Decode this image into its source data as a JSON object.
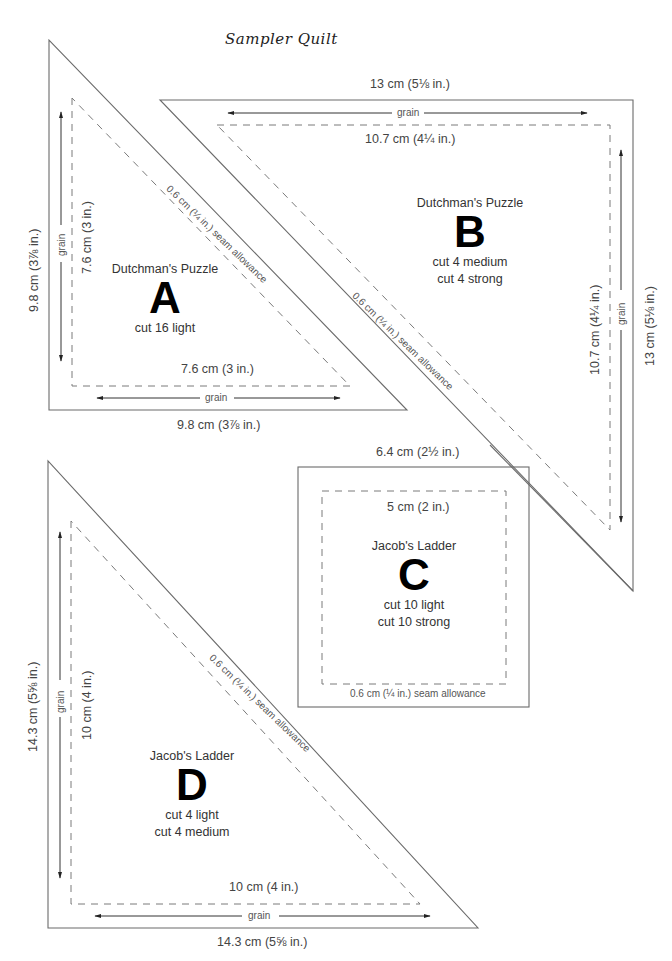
{
  "title": "Sampler Quilt",
  "pieces": {
    "A": {
      "block_name": "Dutchman's Puzzle",
      "letter": "A",
      "cut": [
        "cut 16 light"
      ],
      "outer_vertical": "9.8 cm (3⅞ in.)",
      "inner_vertical": "7.6 cm (3 in.)",
      "inner_horizontal": "7.6 cm (3 in.)",
      "outer_horizontal": "9.8 cm (3⅞ in.)",
      "grain_label": "grain",
      "seam_label": "0.6 cm (¼ in.) seam allowance"
    },
    "B": {
      "block_name": "Dutchman's Puzzle",
      "letter": "B",
      "cut": [
        "cut 4 medium",
        "cut 4 strong"
      ],
      "outer_horizontal": "13 cm (5⅛ in.)",
      "inner_horizontal": "10.7 cm (4¼ in.)",
      "inner_vertical": "10.7 cm (4¼ in.)",
      "outer_vertical": "13 cm (5⅛ in.)",
      "grain_label": "grain",
      "seam_label": "0.6 cm (¼ in.) seam allowance"
    },
    "C": {
      "block_name": "Jacob's Ladder",
      "letter": "C",
      "cut": [
        "cut 10 light",
        "cut 10 strong"
      ],
      "outer_horizontal": "6.4 cm (2½ in.)",
      "inner_horizontal": "5 cm (2 in.)",
      "seam_label": "0.6 cm (¼ in.) seam allowance"
    },
    "D": {
      "block_name": "Jacob's Ladder",
      "letter": "D",
      "cut": [
        "cut 4 light",
        "cut 4 medium"
      ],
      "outer_vertical": "14.3 cm (5⅝ in.)",
      "inner_vertical": "10 cm (4 in.)",
      "inner_horizontal": "10 cm (4 in.)",
      "outer_horizontal": "14.3 cm (5⅝ in.)",
      "grain_label": "grain",
      "seam_label": "0.6 cm (¼ in.) seam allowance"
    }
  }
}
